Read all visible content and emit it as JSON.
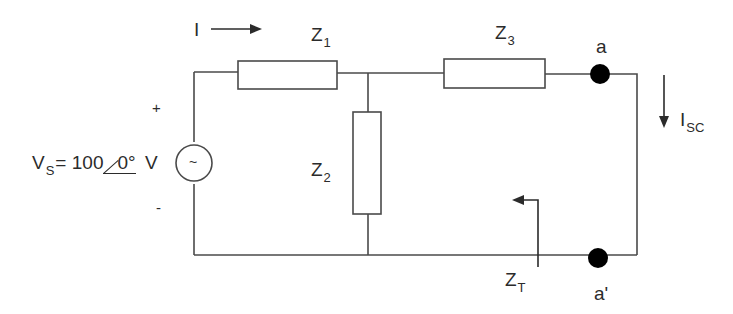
{
  "colors": {
    "wire": "#4a4a4a",
    "text": "#2b2b2b",
    "terminal": "#000000",
    "background": "#ffffff"
  },
  "source": {
    "label_main": "V",
    "label_sub": "S",
    "equals": "=",
    "magnitude": "100",
    "angle": "0°",
    "unit": "V",
    "plus_sign": "+",
    "minus_sign": "-",
    "symbol": "~"
  },
  "current": {
    "label": "I",
    "direction": "right"
  },
  "impedances": {
    "z1": {
      "main": "Z",
      "sub": "1"
    },
    "z2": {
      "main": "Z",
      "sub": "2"
    },
    "z3": {
      "main": "Z",
      "sub": "3"
    },
    "zt": {
      "main": "Z",
      "sub": "T"
    }
  },
  "terminals": {
    "a": "a",
    "a_prime": "a'"
  },
  "short_circuit_current": {
    "main": "I",
    "sub": "SC",
    "direction": "down"
  }
}
